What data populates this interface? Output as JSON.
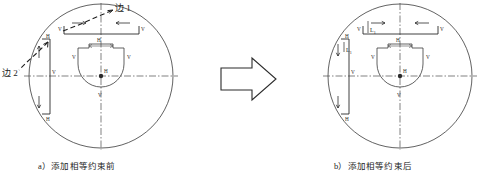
{
  "figure": {
    "background_color": "#ffffff",
    "line_color": "#2b2b2b",
    "construction_color": "#555555",
    "panels": [
      {
        "id": "a",
        "caption": "a）添加相等约束前",
        "leader_labels": [
          {
            "name": "edge-1",
            "text": "边 1"
          },
          {
            "name": "edge-2",
            "text": "边 2"
          }
        ],
        "constraint_markers": [
          {
            "name": "top-bracket-left-v",
            "text": "V"
          },
          {
            "name": "top-bracket-right-v",
            "text": "V"
          },
          {
            "name": "top-axis-h",
            "text": "H"
          },
          {
            "name": "left-bracket-top-h",
            "text": "H"
          },
          {
            "name": "left-bracket-bottom-h",
            "text": "H"
          },
          {
            "name": "left-axis-v",
            "text": "V"
          },
          {
            "name": "inner-left-v",
            "text": "V"
          },
          {
            "name": "inner-right-v",
            "text": "V"
          },
          {
            "name": "inner-top-h",
            "text": "H"
          },
          {
            "name": "center-h",
            "text": "H"
          },
          {
            "name": "inner-bottom-v",
            "text": "V"
          }
        ],
        "dimension_labels": []
      },
      {
        "id": "b",
        "caption": "b）添加相等约束后",
        "leader_labels": [],
        "constraint_markers": [
          {
            "name": "top-bracket-left-v",
            "text": "V"
          },
          {
            "name": "top-bracket-right-v",
            "text": "V"
          },
          {
            "name": "top-axis-h",
            "text": "H"
          },
          {
            "name": "left-bracket-top-h",
            "text": "H"
          },
          {
            "name": "left-bracket-bottom-h",
            "text": "H"
          },
          {
            "name": "left-axis-v",
            "text": "V"
          },
          {
            "name": "inner-left-v",
            "text": "V"
          },
          {
            "name": "inner-right-v",
            "text": "V"
          },
          {
            "name": "inner-top-h",
            "text": "H"
          },
          {
            "name": "center-h",
            "text": "H"
          },
          {
            "name": "inner-bottom-v",
            "text": "V"
          }
        ],
        "dimension_labels": [
          {
            "name": "dimension-top",
            "text": "L",
            "sub": "1"
          },
          {
            "name": "dimension-left",
            "text": "L",
            "sub": "1"
          }
        ]
      }
    ],
    "transition_arrow": {
      "name": "transition-arrow",
      "direction": "right"
    }
  }
}
